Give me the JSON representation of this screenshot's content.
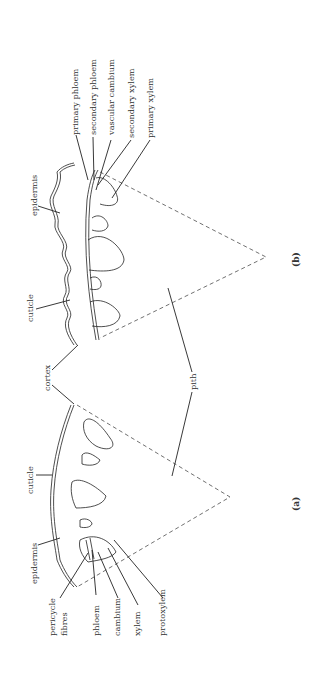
{
  "figure": {
    "panels": [
      {
        "id": "a",
        "caption": "(a)"
      },
      {
        "id": "b",
        "caption": "(b)"
      }
    ],
    "labels_a": {
      "cuticle": "cuticle",
      "epidermis": "epidermis",
      "pericycle": "pericycle",
      "fibres": "fibres",
      "phloem": "phloem",
      "cambium": "cambium",
      "xylem": "xylem",
      "protoxylem": "protoxylem"
    },
    "labels_b": {
      "epidermis": "epidermis",
      "cuticle": "cuticle",
      "primary_phloem": "primary  phloem",
      "secondary_phloem": "secondary  phloem",
      "vascular_cambium": "vascular  cambium",
      "secondary_xylem": "secondary  xylem",
      "primary_xylem": "primary  xylem"
    },
    "shared_labels": {
      "cortex": "cortex",
      "pith": "pith"
    }
  }
}
